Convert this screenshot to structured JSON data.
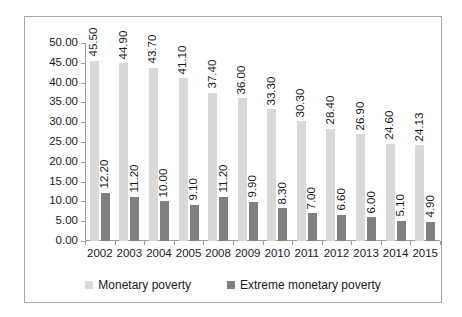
{
  "chart_data": {
    "type": "bar",
    "title": "",
    "subtitle": "",
    "xlabel": "",
    "ylabel": "",
    "ylim": [
      0,
      50
    ],
    "ytick_step": 5,
    "ytick_labels": [
      "50.00",
      "45.00",
      "40.00",
      "35.00",
      "30.00",
      "25.00",
      "20.00",
      "15.00",
      "10.00",
      "5.00",
      "0.00"
    ],
    "grid": false,
    "legend_position": "bottom",
    "categories": [
      "2002",
      "2003",
      "2004",
      "2005",
      "2008",
      "2009",
      "2010",
      "2011",
      "2012",
      "2013",
      "2014",
      "2015"
    ],
    "series": [
      {
        "name": "Monetary poverty",
        "color": "#d9d9d9",
        "values": [
          45.5,
          44.9,
          43.7,
          41.1,
          37.4,
          36.0,
          33.3,
          30.3,
          28.4,
          26.9,
          24.6,
          24.13
        ],
        "labels": [
          "45.50",
          "44.90",
          "43.70",
          "41.10",
          "37.40",
          "36.00",
          "33.30",
          "30.30",
          "28.40",
          "26.90",
          "24.60",
          "24.13"
        ]
      },
      {
        "name": "Extreme monetary poverty",
        "color": "#808080",
        "values": [
          12.2,
          11.2,
          10.0,
          9.1,
          11.2,
          9.9,
          8.3,
          7.0,
          6.6,
          6.0,
          5.1,
          4.9
        ],
        "labels": [
          "12.20",
          "11.20",
          "10.00",
          "9.10",
          "11.20",
          "9.90",
          "8.30",
          "7.00",
          "6.60",
          "6.00",
          "5.10",
          "4.90"
        ]
      }
    ]
  }
}
